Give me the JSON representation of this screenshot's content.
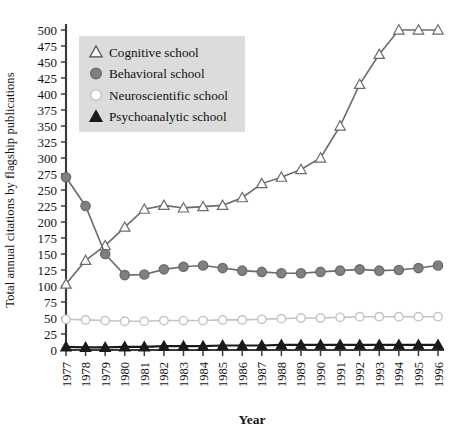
{
  "chart_data": {
    "type": "line",
    "title": "",
    "xlabel": "Year",
    "ylabel": "Total annual citations by flagship publications",
    "x": [
      1977,
      1978,
      1979,
      1980,
      1981,
      1982,
      1983,
      1984,
      1985,
      1986,
      1987,
      1988,
      1989,
      1990,
      1991,
      1992,
      1993,
      1994,
      1995,
      1996
    ],
    "xtick_labels": [
      "1977",
      "1978",
      "1979",
      "1980",
      "1981",
      "1982",
      "1983",
      "1984",
      "1985",
      "1986",
      "1987",
      "1988",
      "1989",
      "1990",
      "1991",
      "1992",
      "1993",
      "1994",
      "1995",
      "1996"
    ],
    "ytick_labels": [
      "0",
      "25",
      "50",
      "75",
      "100",
      "125",
      "150",
      "175",
      "200",
      "225",
      "250",
      "275",
      "300",
      "325",
      "350",
      "375",
      "400",
      "425",
      "450",
      "475",
      "500"
    ],
    "ytick_values": [
      0,
      25,
      50,
      75,
      100,
      125,
      150,
      175,
      200,
      225,
      250,
      275,
      300,
      325,
      350,
      375,
      400,
      425,
      450,
      475,
      500
    ],
    "ylim": [
      0,
      512
    ],
    "xlim": [
      1976.6,
      1996.6
    ],
    "grid": false,
    "legend_position": "upper-left",
    "series": [
      {
        "name": "Cognitive school",
        "marker": "triangle-open",
        "color": "#6b6b6b",
        "fill": "#ffffff",
        "values": [
          103,
          140,
          163,
          192,
          220,
          226,
          222,
          224,
          226,
          238,
          260,
          270,
          282,
          300,
          350,
          415,
          462,
          500,
          500,
          500
        ]
      },
      {
        "name": "Behavioral school",
        "marker": "circle-filled",
        "color": "#6b6b6b",
        "fill": "#808080",
        "values": [
          270,
          225,
          150,
          117,
          118,
          126,
          130,
          132,
          128,
          124,
          122,
          120,
          120,
          122,
          124,
          126,
          124,
          125,
          128,
          132
        ]
      },
      {
        "name": "Neuroscientific school",
        "marker": "circle-open",
        "color": "#c4c4c4",
        "fill": "#ffffff",
        "values": [
          48,
          47,
          46,
          45,
          45,
          46,
          46,
          46,
          47,
          47,
          48,
          49,
          50,
          50,
          51,
          52,
          52,
          52,
          52,
          52
        ]
      },
      {
        "name": "Psychoanalytic school",
        "marker": "triangle-filled",
        "color": "#1a1a1a",
        "fill": "#1a1a1a",
        "values": [
          5,
          4,
          4,
          5,
          5,
          6,
          6,
          6,
          7,
          7,
          7,
          8,
          8,
          8,
          8,
          8,
          8,
          8,
          8,
          8
        ]
      }
    ]
  },
  "legend": {
    "entries": [
      {
        "label": "Cognitive school",
        "marker": "triangle-open"
      },
      {
        "label": "Behavioral school",
        "marker": "circle-filled"
      },
      {
        "label": "Neuroscientific school",
        "marker": "circle-open"
      },
      {
        "label": "Psychoanalytic school",
        "marker": "triangle-filled"
      }
    ],
    "background": "#dcdcdc"
  }
}
